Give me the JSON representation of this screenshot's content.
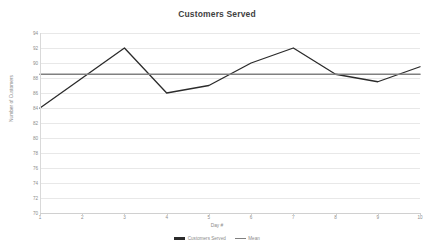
{
  "chart_data": {
    "type": "line",
    "title": "Customers Served",
    "xlabel": "Day #",
    "ylabel": "Number of Customers",
    "categories": [
      "1",
      "2",
      "3",
      "4",
      "5",
      "6",
      "7",
      "8",
      "9",
      "10"
    ],
    "x": [
      1,
      2,
      3,
      4,
      5,
      6,
      7,
      8,
      9,
      10
    ],
    "series": [
      {
        "name": "Customers Served",
        "color": "#2b2b2b",
        "values": [
          84,
          88,
          92,
          86,
          87,
          90,
          92,
          88.5,
          87.5,
          89.5
        ]
      },
      {
        "name": "Mean",
        "color": "#808080",
        "values": [
          88.5,
          88.5,
          88.5,
          88.5,
          88.5,
          88.5,
          88.5,
          88.5,
          88.5,
          88.5
        ]
      }
    ],
    "ylim": [
      70,
      94
    ],
    "ytick_values": [
      94,
      92,
      90,
      88,
      86,
      84,
      82,
      80,
      78,
      76,
      74,
      72,
      70
    ],
    "ytick_labels": [
      "94",
      "92",
      "90",
      "88",
      "86",
      "84",
      "82",
      "80",
      "78",
      "76",
      "74",
      "72",
      "70"
    ],
    "xlim": [
      1,
      10
    ],
    "grid": true,
    "legend_position": "bottom"
  },
  "legend": [
    {
      "label": "Customers Served",
      "color": "#2b2b2b"
    },
    {
      "label": "Mean",
      "color": "#808080"
    }
  ],
  "colors": {
    "series_line": "#2b2b2b",
    "mean_line": "#808080",
    "gridline": "#e8e8e8",
    "tick_text": "#8c8c8c",
    "title_text": "#3f3f3f",
    "background": "#ffffff"
  }
}
